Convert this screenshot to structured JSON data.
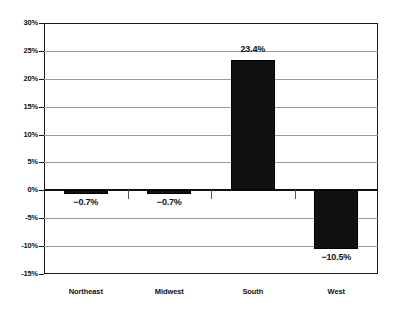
{
  "chart_data": {
    "type": "bar",
    "title": "",
    "subtitle": "",
    "xlabel": "",
    "ylabel": "",
    "categories": [
      "Northeast",
      "Midwest",
      "South",
      "West"
    ],
    "values": [
      -0.7,
      -0.7,
      23.4,
      -10.5
    ],
    "data_labels": [
      "−0.7%",
      "−0.7%",
      "23.4%",
      "−10.5%"
    ],
    "ylim": [
      -15,
      30
    ],
    "ytick_values": [
      30,
      25,
      20,
      15,
      10,
      5,
      0,
      -5,
      -10,
      -15
    ],
    "ytick_labels": [
      "30%",
      "25%",
      "20%",
      "15%",
      "10%",
      "5%",
      "0%",
      "-5%",
      "-10%",
      "-15%"
    ],
    "grid": true,
    "legend": null,
    "legend_position": "none",
    "bar_color": "#111111",
    "grid_color": "#9a9a9a",
    "axis_color": "#1a1a1a",
    "background_color": "#ffffff",
    "label_placement": [
      "below-bar",
      "below-bar",
      "above-bar",
      "below-bar"
    ]
  }
}
